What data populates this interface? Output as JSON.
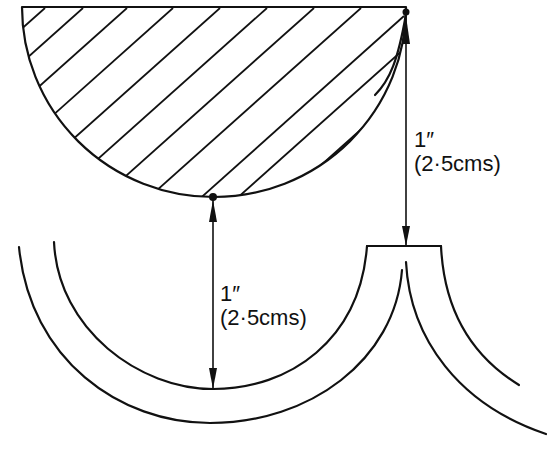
{
  "diagram": {
    "title": "",
    "colors": {
      "ink": "#111111",
      "background": "#ffffff"
    },
    "shapes": {
      "hatched_semicircle": {
        "left_x": 22,
        "right_x": 406,
        "top_y": 8,
        "bottom_y": 197,
        "fill_pattern": "diagonal-hatch"
      },
      "lower_arc_pair_left": {
        "inner_bottom_y": 389,
        "outer_bottom_y": 423
      },
      "lower_arc_pair_right": {
        "top_bar_left_x": 367,
        "top_bar_right_x": 441,
        "top_bar_y": 246
      }
    },
    "dimensions": [
      {
        "id": "right",
        "value_imperial": "1″",
        "value_metric": "(2·5cms)",
        "from": [
          406,
          12
        ],
        "to": [
          406,
          246
        ]
      },
      {
        "id": "center",
        "value_imperial": "1″",
        "value_metric": "(2·5cms)",
        "from": [
          213,
          197
        ],
        "to": [
          213,
          389
        ]
      }
    ]
  }
}
